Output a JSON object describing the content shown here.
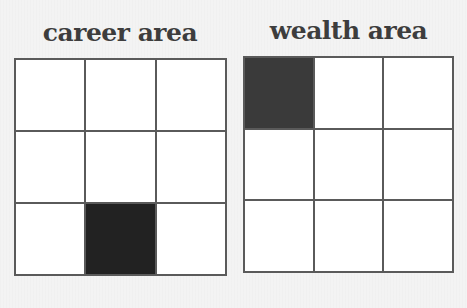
{
  "panels": [
    {
      "title": "career area",
      "grid": {
        "rows": 3,
        "cols": 3,
        "filled_cells": [
          [
            2,
            1
          ]
        ],
        "fill_color": "#222222"
      }
    },
    {
      "title": "wealth area",
      "grid": {
        "rows": 3,
        "cols": 3,
        "filled_cells": [
          [
            0,
            0
          ]
        ],
        "fill_color": "#3a3a3a"
      }
    }
  ],
  "colors": {
    "background": "#f3f3f3",
    "grid_line": "#5a5a5a",
    "cell_empty": "#ffffff",
    "title_text": "#3d3d3d"
  }
}
